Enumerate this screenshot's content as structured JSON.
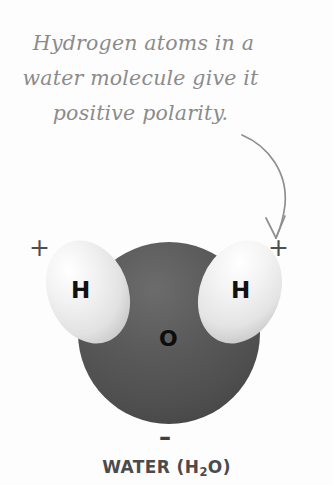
{
  "figure": {
    "title_caption": "WATER (H",
    "caption": {
      "main": "WATER (H",
      "subscript": "2",
      "tail": "O)"
    },
    "annotation": {
      "line1": "Hydrogen atoms in a",
      "line2": "water molecule give it",
      "line3": "positive polarity.",
      "color": "#8b8b8b"
    },
    "arrow": {
      "name": "curved-pointer-arrow",
      "color": "#8b8b8b",
      "points_to": "right-hydrogen-atom"
    },
    "atoms": [
      {
        "id": "hydrogen-left",
        "label": "H",
        "charge": "+",
        "color": "#efefef",
        "shadow_color": "#b9b9b9"
      },
      {
        "id": "oxygen",
        "label": "O",
        "charge": "–",
        "color": "#565656",
        "shadow_color": "#3f3f3f"
      },
      {
        "id": "hydrogen-right",
        "label": "H",
        "charge": "+",
        "color": "#efefef",
        "shadow_color": "#b9b9b9"
      }
    ],
    "charges": {
      "left_plus": "+",
      "right_plus": "+",
      "bottom_minus": "–"
    },
    "background": "#fdfdfd"
  }
}
